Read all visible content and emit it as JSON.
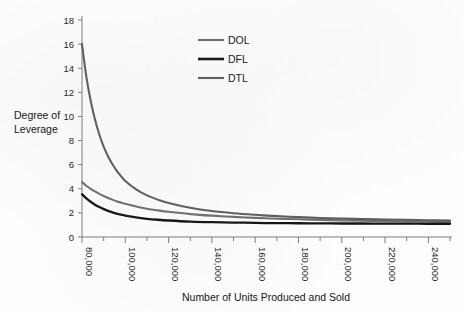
{
  "chart_data": {
    "type": "line",
    "title": "",
    "xlabel": "Number of Units Produced and Sold",
    "ylabel": "Degree of Leverage",
    "ylabel_line1": "Degree of",
    "ylabel_line2": "Leverage",
    "xlim": [
      80000,
      250000
    ],
    "ylim": [
      0,
      18
    ],
    "grid": false,
    "legend_position": "top-center",
    "y_ticks": [
      0,
      2,
      4,
      6,
      8,
      10,
      12,
      14,
      16,
      18
    ],
    "y_tick_labels": [
      "0",
      "2",
      "4",
      "6",
      "8",
      "10",
      "12",
      "14",
      "16",
      "18"
    ],
    "x_ticks": [
      80000,
      90000,
      100000,
      110000,
      120000,
      130000,
      140000,
      150000,
      160000,
      170000,
      180000,
      190000,
      200000,
      210000,
      220000,
      230000,
      240000,
      250000
    ],
    "x_tick_labels_major": [
      "80,000",
      "100,000",
      "120,000",
      "140,000",
      "160,000",
      "180,000",
      "200,000",
      "220,000",
      "240,000"
    ],
    "x_major_values": [
      80000,
      100000,
      120000,
      140000,
      160000,
      180000,
      200000,
      220000,
      240000
    ],
    "x": [
      80000,
      82000,
      84000,
      86000,
      88000,
      90000,
      92000,
      94000,
      96000,
      98000,
      100000,
      105000,
      110000,
      115000,
      120000,
      130000,
      140000,
      150000,
      160000,
      170000,
      180000,
      190000,
      200000,
      210000,
      220000,
      230000,
      240000,
      250000
    ],
    "series": [
      {
        "name": "DOL",
        "color": "#6f6f6f",
        "width": 2.1,
        "values": [
          4.55,
          4.25,
          4.0,
          3.78,
          3.58,
          3.4,
          3.24,
          3.1,
          2.97,
          2.86,
          2.75,
          2.53,
          2.35,
          2.21,
          2.09,
          1.9,
          1.77,
          1.67,
          1.59,
          1.52,
          1.47,
          1.42,
          1.38,
          1.35,
          1.32,
          1.3,
          1.28,
          1.26
        ]
      },
      {
        "name": "DFL",
        "color": "#141414",
        "width": 2.3,
        "values": [
          3.55,
          3.2,
          2.92,
          2.68,
          2.48,
          2.31,
          2.17,
          2.05,
          1.94,
          1.85,
          1.77,
          1.62,
          1.51,
          1.43,
          1.37,
          1.28,
          1.23,
          1.2,
          1.17,
          1.15,
          1.14,
          1.13,
          1.12,
          1.12,
          1.11,
          1.11,
          1.1,
          1.1
        ]
      },
      {
        "name": "DTL",
        "color": "#5e5e5e",
        "width": 2.1,
        "values": [
          16.0,
          13.3,
          11.3,
          9.75,
          8.5,
          7.5,
          6.7,
          6.05,
          5.5,
          5.05,
          4.65,
          3.95,
          3.45,
          3.1,
          2.82,
          2.42,
          2.15,
          1.97,
          1.84,
          1.73,
          1.65,
          1.58,
          1.53,
          1.48,
          1.45,
          1.42,
          1.39,
          1.37
        ]
      }
    ],
    "legend_entries": [
      {
        "label": "DOL",
        "color": "#6f6f6f"
      },
      {
        "label": "DFL",
        "color": "#141414"
      },
      {
        "label": "DTL",
        "color": "#5e5e5e"
      }
    ]
  }
}
